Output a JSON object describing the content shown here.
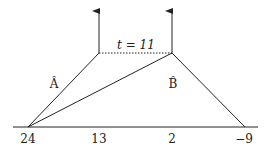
{
  "diagram": {
    "time_label": "t = 11",
    "node_labels": {
      "a": "Â",
      "b": "B̂"
    },
    "axis_labels": [
      "24",
      "13",
      "2",
      "−9"
    ],
    "colors": {
      "line": "#222222",
      "background": "#ffffff"
    }
  }
}
